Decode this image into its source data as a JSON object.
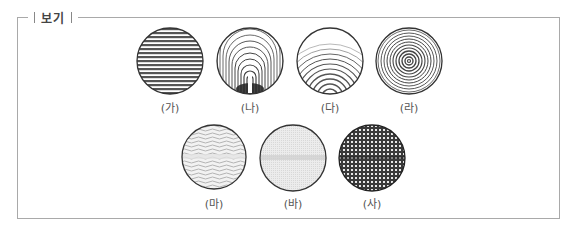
{
  "box": {
    "title": "보기",
    "border_color": "#a9a9a9"
  },
  "figures": [
    {
      "label": "(가)",
      "pattern": "horizontal-stripes"
    },
    {
      "label": "(나)",
      "pattern": "nested-arches-dense-bottom"
    },
    {
      "label": "(다)",
      "pattern": "concentric-arcs-from-bottom"
    },
    {
      "label": "(라)",
      "pattern": "concentric-rings"
    },
    {
      "label": "(마)",
      "pattern": "wavy-lines"
    },
    {
      "label": "(바)",
      "pattern": "fine-light-grid"
    },
    {
      "label": "(사)",
      "pattern": "dark-checker-grid"
    }
  ]
}
